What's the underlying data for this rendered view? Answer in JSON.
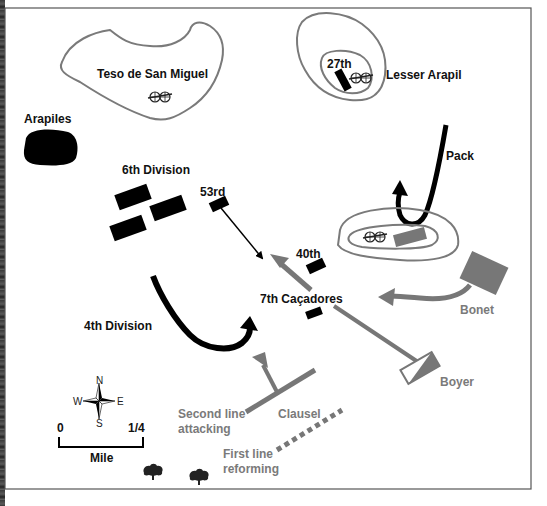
{
  "map": {
    "title": "Battle of Salamanca - Arapiles sector",
    "colors": {
      "allied": "#000000",
      "french": "#777777",
      "contour": "#7a7a7a",
      "frame": "#555555"
    },
    "terrain": {
      "teso": "Teso de San Miguel",
      "arapiles": "Arapiles",
      "lesser_arapil": "Lesser Arapil"
    },
    "allied_units": {
      "sixth_division": "6th Division",
      "fifty_third": "53rd",
      "fortieth": "40th",
      "twenty_seventh": "27th",
      "seventh_cacadores": "7th Caçadores",
      "fourth_division": "4th Division",
      "pack": "Pack"
    },
    "french_units": {
      "bonet": "Bonet",
      "boyer": "Boyer",
      "clausel": "Clausel",
      "second_line_1": "Second line",
      "second_line_2": "attacking",
      "first_line_1": "First line",
      "first_line_2": "reforming"
    },
    "legend": {
      "compass": {
        "n": "N",
        "s": "S",
        "e": "E",
        "w": "W"
      },
      "scale": {
        "start": "0",
        "end": "1/4",
        "unit": "Mile"
      }
    },
    "icons": [
      "artillery-icon",
      "tree-icon",
      "compass-rose-icon"
    ]
  }
}
